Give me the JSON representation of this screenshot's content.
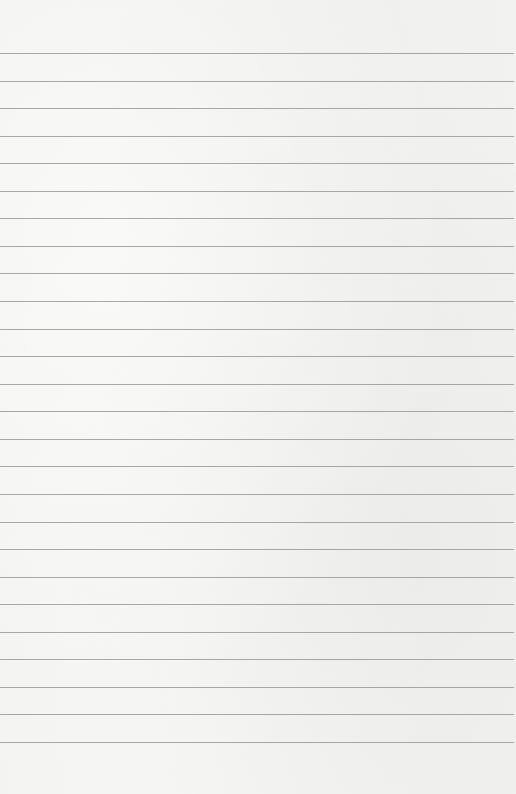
{
  "page": {
    "type": "lined-paper",
    "background_color": "#f2f2f0",
    "line_color": "#8e8e8e",
    "first_line_y": 53,
    "line_spacing": 27.56,
    "line_count": 26
  }
}
